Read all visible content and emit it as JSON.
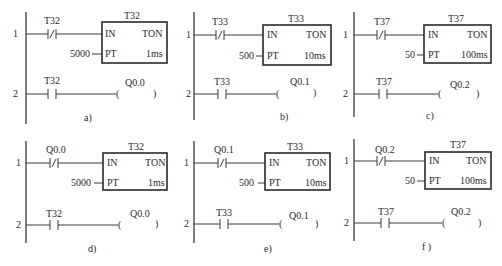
{
  "panels": [
    {
      "id": "a",
      "caption": "a)",
      "rung1": {
        "number": "1",
        "contact_label": "T32",
        "contact_type": "normally-closed",
        "timer": {
          "name": "T32",
          "type": "TON",
          "in_pin": "IN",
          "pt_pin": "PT",
          "pt_value": "5000",
          "resolution": "1ms"
        }
      },
      "rung2": {
        "number": "2",
        "contact_label": "T32",
        "contact_type": "normally-open",
        "coil_label": "Q0.0",
        "coil_open": "(",
        "coil_close": ")"
      }
    },
    {
      "id": "b",
      "caption": "b)",
      "rung1": {
        "number": "1",
        "contact_label": "T33",
        "contact_type": "normally-closed",
        "timer": {
          "name": "T33",
          "type": "TON",
          "in_pin": "IN",
          "pt_pin": "PT",
          "pt_value": "500",
          "resolution": "10ms"
        }
      },
      "rung2": {
        "number": "2",
        "contact_label": "T33",
        "contact_type": "normally-open",
        "coil_label": "Q0.1",
        "coil_open": "(",
        "coil_close": ")"
      }
    },
    {
      "id": "c",
      "caption": "c)",
      "rung1": {
        "number": "1",
        "contact_label": "T37",
        "contact_type": "normally-closed",
        "timer": {
          "name": "T37",
          "type": "TON",
          "in_pin": "IN",
          "pt_pin": "PT",
          "pt_value": "50",
          "resolution": "100ms"
        }
      },
      "rung2": {
        "number": "2",
        "contact_label": "T37",
        "contact_type": "normally-open",
        "coil_label": "Q0.2",
        "coil_open": "(",
        "coil_close": ")"
      }
    },
    {
      "id": "d",
      "caption": "d)",
      "rung1": {
        "number": "1",
        "contact_label": "Q0.0",
        "contact_type": "normally-closed",
        "timer": {
          "name": "T32",
          "type": "TON",
          "in_pin": "IN",
          "pt_pin": "PT",
          "pt_value": "5000",
          "resolution": "1ms"
        }
      },
      "rung2": {
        "number": "2",
        "contact_label": "T32",
        "contact_type": "normally-open",
        "coil_label": "Q0.0",
        "coil_open": "(",
        "coil_close": ")"
      }
    },
    {
      "id": "e",
      "caption": "e)",
      "rung1": {
        "number": "1",
        "contact_label": "Q0.1",
        "contact_type": "normally-closed",
        "timer": {
          "name": "T33",
          "type": "TON",
          "in_pin": "IN",
          "pt_pin": "PT",
          "pt_value": "500",
          "resolution": "10ms"
        }
      },
      "rung2": {
        "number": "2",
        "contact_label": "T33",
        "contact_type": "normally-open",
        "coil_label": "Q0.1",
        "coil_open": "(",
        "coil_close": ")"
      }
    },
    {
      "id": "f",
      "caption": "f )",
      "rung1": {
        "number": "1",
        "contact_label": "Q0.2",
        "contact_type": "normally-closed",
        "timer": {
          "name": "T37",
          "type": "TON",
          "in_pin": "IN",
          "pt_pin": "PT",
          "pt_value": "50",
          "resolution": "100ms"
        }
      },
      "rung2": {
        "number": "2",
        "contact_label": "T37",
        "contact_type": "normally-open",
        "coil_label": "Q0.2",
        "coil_open": "(",
        "coil_close": ")"
      }
    }
  ],
  "colors": {
    "line": "#3a3a3a",
    "box_border": "#2a2a2a",
    "background": "#ffffff"
  }
}
